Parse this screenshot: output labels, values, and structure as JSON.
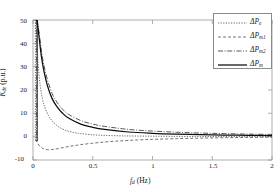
{
  "chart_data": {
    "type": "line",
    "title": "",
    "xlabel": "f_d (Hz)",
    "ylabel": "K_de (p.u.)",
    "xlim": [
      0,
      2
    ],
    "ylim": [
      -10,
      50
    ],
    "xticks": [
      "0",
      "0.5",
      "1",
      "1.5",
      "2"
    ],
    "yticks": [
      "50",
      "40",
      "30",
      "20",
      "10",
      "0",
      "-10"
    ],
    "grid": false,
    "legend_position": "upper-right",
    "series": [
      {
        "name": "dPe",
        "label": "ΔP_e",
        "style": "dash-dot",
        "color": "#4a4a4a",
        "x": [
          0.02,
          0.04,
          0.06,
          0.08,
          0.1,
          0.13,
          0.16,
          0.2,
          0.25,
          0.3,
          0.35,
          0.4,
          0.5,
          0.6,
          0.7,
          0.8,
          1.0,
          1.2,
          1.4,
          1.6,
          1.8,
          2.0
        ],
        "y": [
          50.0,
          33.0,
          22.0,
          16.0,
          12.5,
          9.0,
          6.8,
          4.8,
          3.2,
          2.3,
          1.7,
          1.3,
          0.8,
          0.55,
          0.4,
          0.3,
          0.2,
          0.12,
          0.08,
          0.05,
          0.03,
          0.02
        ]
      },
      {
        "name": "dPm1",
        "label": "ΔP_m1",
        "style": "dashed",
        "color": "#5a5a5a",
        "x": [
          0.02,
          0.05,
          0.08,
          0.12,
          0.16,
          0.2,
          0.25,
          0.3,
          0.35,
          0.4,
          0.5,
          0.6,
          0.7,
          0.8,
          0.9,
          1.0,
          1.2,
          1.4,
          1.6,
          1.8,
          2.0
        ],
        "y": [
          -1.2,
          -3.6,
          -5.0,
          -5.6,
          -5.5,
          -5.2,
          -4.7,
          -4.2,
          -3.8,
          -3.4,
          -2.8,
          -2.3,
          -1.9,
          -1.6,
          -1.35,
          -1.15,
          -0.85,
          -0.62,
          -0.45,
          -0.32,
          -0.22
        ]
      },
      {
        "name": "dPm2",
        "label": "ΔP_m2",
        "style": "dash-dot-long",
        "color": "#3a3a3a",
        "x": [
          0.03,
          0.05,
          0.07,
          0.09,
          0.12,
          0.16,
          0.2,
          0.25,
          0.3,
          0.4,
          0.5,
          0.6,
          0.8,
          1.0,
          1.2,
          1.4,
          1.6,
          1.8,
          2.0
        ],
        "y": [
          50.0,
          45.0,
          37.0,
          31.0,
          24.5,
          18.5,
          14.8,
          11.6,
          9.5,
          6.9,
          5.4,
          4.4,
          3.1,
          2.4,
          1.9,
          1.55,
          1.3,
          1.1,
          0.95
        ]
      },
      {
        "name": "dPm",
        "label": "ΔP_m",
        "style": "solid",
        "color": "#0d0d0d",
        "x": [
          0.035,
          0.05,
          0.07,
          0.09,
          0.12,
          0.16,
          0.2,
          0.25,
          0.3,
          0.4,
          0.5,
          0.6,
          0.8,
          1.0,
          1.2,
          1.4,
          1.6,
          1.8,
          2.0
        ],
        "y": [
          50.0,
          43.0,
          34.5,
          28.5,
          22.0,
          16.3,
          12.9,
          9.9,
          7.9,
          5.4,
          4.0,
          3.1,
          2.0,
          1.45,
          1.1,
          0.85,
          0.68,
          0.55,
          0.45
        ]
      }
    ]
  },
  "axes": {
    "ylabel_k": "K",
    "ylabel_sub": "de",
    "ylabel_unit": " (p.u.)",
    "xlabel_f": "f",
    "xlabel_sub": "d",
    "xlabel_unit": " (Hz)"
  },
  "legend": {
    "items": [
      {
        "delta": "ΔP",
        "sub": "e",
        "style": "dash-dot"
      },
      {
        "delta": "ΔP",
        "sub": "m1",
        "style": "dashed"
      },
      {
        "delta": "ΔP",
        "sub": "m2",
        "style": "dash-dot-long"
      },
      {
        "delta": "ΔP",
        "sub": "m",
        "style": "solid"
      }
    ]
  }
}
